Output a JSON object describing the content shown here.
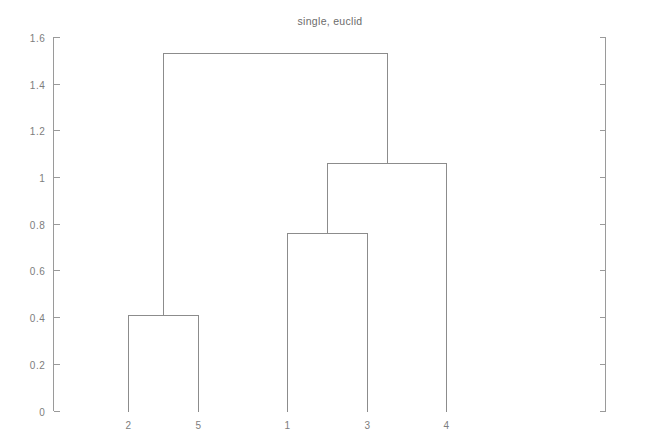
{
  "chart_data": {
    "type": "line",
    "subtype": "dendrogram",
    "title": "single, euclid",
    "xlabel": "",
    "ylabel": "",
    "grid": false,
    "legend": null,
    "linkage_method": "single",
    "distance_metric": "euclid",
    "leaf_order": [
      "2",
      "5",
      "1",
      "3",
      "4"
    ],
    "x_tick_labels": [
      "2",
      "5",
      "1",
      "3",
      "4"
    ],
    "x_tick_positions": [
      1,
      2,
      3,
      4,
      5
    ],
    "xlim": [
      0.5,
      5.5
    ],
    "y_tick_labels": [
      "0",
      "0.2",
      "0.4",
      "0.6",
      "0.8",
      "1",
      "1.2",
      "1.4",
      "1.6"
    ],
    "y_tick_values": [
      0,
      0.2,
      0.4,
      0.6,
      0.8,
      1.0,
      1.2,
      1.4,
      1.6
    ],
    "ylim": [
      0,
      1.6
    ],
    "merges": [
      {
        "id": "m1",
        "label": "2-5",
        "left": "2",
        "right": "5",
        "left_x": 1,
        "right_x": 2,
        "height": 0.41
      },
      {
        "id": "m2",
        "label": "1-3",
        "left": "1",
        "right": "3",
        "left_x": 3,
        "right_x": 4,
        "height": 0.76
      },
      {
        "id": "m3",
        "label": "(1-3)-4",
        "left": "m2",
        "right": "4",
        "left_x": 3.5,
        "right_x": 5,
        "height": 1.06
      },
      {
        "id": "m4",
        "label": "(2-5)-((1-3)-4)",
        "left": "m1",
        "right": "m3",
        "left_x": 1.5,
        "right_x": 4.25,
        "height": 1.53
      }
    ],
    "values": [
      0.41,
      0.76,
      1.06,
      1.53
    ],
    "colors": {
      "line": "#8c8c8c",
      "axis": "#9a9a9a",
      "text": "#7d7d7d",
      "background": "#ffffff"
    }
  }
}
